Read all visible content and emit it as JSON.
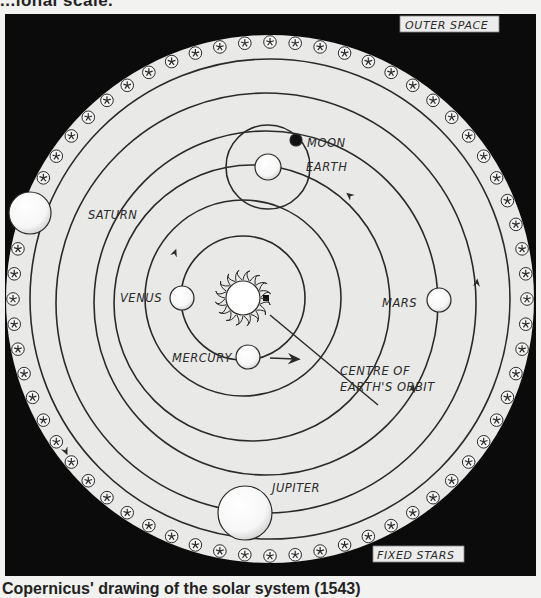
{
  "page": {
    "top_text_partial": "...ional scale.",
    "caption": "Copernicus' drawing of the solar system (1543)"
  },
  "diagram": {
    "corner_labels": {
      "outer_space": "OUTER SPACE",
      "fixed_stars": "FIXED STARS"
    },
    "center": {
      "label": "SUN"
    },
    "annotation": {
      "line1": "CENTRE OF",
      "line2": "EARTH'S ORBIT"
    },
    "bodies": [
      {
        "name": "MERCURY",
        "order": 1
      },
      {
        "name": "VENUS",
        "order": 2
      },
      {
        "name": "EARTH",
        "order": 3,
        "satellite": "MOON"
      },
      {
        "name": "MARS",
        "order": 4
      },
      {
        "name": "JUPITER",
        "order": 5
      },
      {
        "name": "SATURN",
        "order": 6
      }
    ],
    "fixed_star_count": 64,
    "colors": {
      "space": "#0b0b0b",
      "disc": "#e9e9e7",
      "ink": "#2a2a2a",
      "planet_fill": "#ffffff"
    }
  }
}
